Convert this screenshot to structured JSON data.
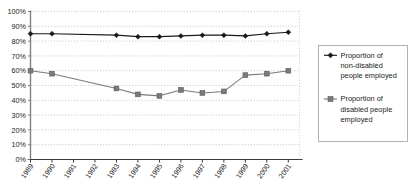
{
  "chart_data": {
    "type": "line",
    "title": "",
    "xlabel": "",
    "ylabel": "",
    "categories": [
      "1989",
      "1990",
      "1991",
      "1992",
      "1993",
      "1994",
      "1995",
      "1996",
      "1997",
      "1998",
      "1999",
      "2000",
      "2001"
    ],
    "ylim": [
      0,
      100
    ],
    "ytick_labels": [
      "0%",
      "10%",
      "20%",
      "30%",
      "40%",
      "50%",
      "60%",
      "70%",
      "80%",
      "90%",
      "100%"
    ],
    "ytick_values": [
      0,
      10,
      20,
      30,
      40,
      50,
      60,
      70,
      80,
      90,
      100
    ],
    "grid": true,
    "grid_style": "dotted-horizontal",
    "legend_position": "right",
    "series": [
      {
        "name": "Proportion of non-disabled people employed",
        "marker": "diamond",
        "color": "#1a1a1a",
        "values": [
          85,
          85,
          null,
          null,
          84,
          83,
          83,
          83.5,
          84,
          84,
          83.5,
          85,
          86
        ],
        "marker_years": [
          "1989",
          "1990",
          "1993",
          "1994",
          "1995",
          "1996",
          "1997",
          "1998",
          "1999",
          "2000",
          "2001"
        ]
      },
      {
        "name": "Proportion of disabled people employed",
        "marker": "square",
        "color": "#7a7a7a",
        "values": [
          60,
          58,
          null,
          null,
          48,
          44,
          43,
          47,
          45,
          46,
          57,
          58,
          60
        ],
        "marker_years": [
          "1989",
          "1990",
          "1993",
          "1994",
          "1995",
          "1996",
          "1997",
          "1998",
          "1999",
          "2000",
          "2001"
        ]
      }
    ],
    "legend": [
      {
        "label_lines": [
          "Proportion of",
          "non-disabled",
          "people employed"
        ],
        "marker": "diamond",
        "color": "#1a1a1a"
      },
      {
        "label_lines": [
          "Proportion of",
          "disabled people",
          "employed"
        ],
        "marker": "square",
        "color": "#7a7a7a"
      }
    ],
    "colors": {
      "series1": "#1a1a1a",
      "series2": "#7a7a7a",
      "axis": "#808080",
      "grid": "#b5b5b5",
      "legend_border": "#a0a0a0",
      "background": "#ffffff"
    }
  }
}
